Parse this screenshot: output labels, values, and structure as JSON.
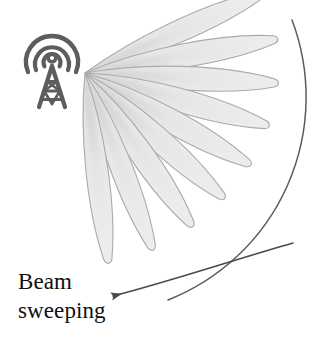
{
  "figure": {
    "title": "Beam sweeping",
    "caption_lines": [
      "Beam",
      "sweeping"
    ],
    "background_color": "#ffffff",
    "icons": {
      "tower": "antenna-tower-icon",
      "sweep_arrow": "sweep-arrow-icon",
      "arc": "coverage-arc"
    },
    "colors": {
      "lobe_fill": "#ebebeb",
      "lobe_stroke": "#a8a8a8",
      "tower": "#5a5a5a",
      "arc_stroke": "#585858",
      "arrow_stroke": "#4a4a4a",
      "text": "#101010"
    },
    "beam": {
      "origin_x": 85,
      "origin_y": 73,
      "lobe_count": 9,
      "lobe_length_px": 196,
      "lobe_half_width_px": 16,
      "sweep_start_deg": -24,
      "sweep_end_deg": 83,
      "lobes": [
        {
          "index": 1,
          "angle_deg": -24,
          "length": 196,
          "half_width": 15
        },
        {
          "index": 2,
          "angle_deg": -10,
          "length": 196,
          "half_width": 16
        },
        {
          "index": 3,
          "angle_deg": 3,
          "length": 194,
          "half_width": 16
        },
        {
          "index": 4,
          "angle_deg": 16,
          "length": 192,
          "half_width": 16
        },
        {
          "index": 5,
          "angle_deg": 29,
          "length": 190,
          "half_width": 16
        },
        {
          "index": 6,
          "angle_deg": 42,
          "length": 188,
          "half_width": 16
        },
        {
          "index": 7,
          "angle_deg": 55,
          "length": 188,
          "half_width": 16
        },
        {
          "index": 8,
          "angle_deg": 69,
          "length": 190,
          "half_width": 15
        },
        {
          "index": 9,
          "angle_deg": 83,
          "length": 194,
          "half_width": 15
        }
      ]
    },
    "arc": {
      "start_x": 292,
      "start_y": 20,
      "end_x": 168,
      "end_y": 300,
      "radius": 218
    },
    "arrow": {
      "tail_x": 292,
      "tail_y": 245,
      "head_x": 110,
      "head_y": 297,
      "direction": "down-left"
    }
  }
}
